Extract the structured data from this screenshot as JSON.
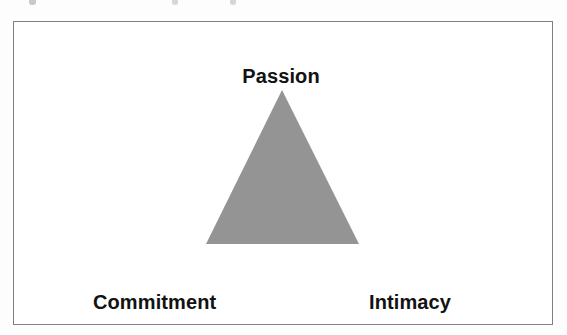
{
  "figure": {
    "type": "triangle-diagram",
    "background_color": "#ffffff",
    "frame": {
      "border_color": "#7e7e84",
      "x": 13,
      "y": 21,
      "width": 540,
      "height": 304
    },
    "triangle": {
      "fill_color": "#949494",
      "apex": {
        "x": 282,
        "y": 90
      },
      "base_left": {
        "x": 206,
        "y": 244
      },
      "base_right": {
        "x": 359,
        "y": 244
      }
    },
    "labels": {
      "apex": "Passion",
      "bottom_left": "Commitment",
      "bottom_right": "Intimacy",
      "text_color": "#121212"
    }
  },
  "chart_data": {
    "type": "diagram",
    "title": "",
    "categories": [
      "Passion",
      "Commitment",
      "Intimacy"
    ],
    "values": [
      1,
      1,
      1
    ],
    "xlabel": "",
    "ylabel": "",
    "annotations": [
      "Passion",
      "Commitment",
      "Intimacy"
    ],
    "legend": [],
    "grid": false
  }
}
